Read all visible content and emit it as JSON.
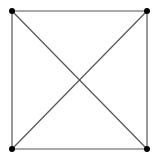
{
  "diagram": {
    "type": "graph",
    "colors": {
      "background": "#ffffff",
      "edge": "#555555",
      "node": "#000000"
    },
    "nodes": [
      {
        "id": "top-left",
        "x": 12,
        "y": 11
      },
      {
        "id": "top-right",
        "x": 147,
        "y": 11
      },
      {
        "id": "bottom-left",
        "x": 12,
        "y": 149
      },
      {
        "id": "bottom-right",
        "x": 147,
        "y": 149
      }
    ],
    "edges": [
      {
        "from": "top-left",
        "to": "top-right"
      },
      {
        "from": "top-right",
        "to": "bottom-right"
      },
      {
        "from": "bottom-right",
        "to": "bottom-left"
      },
      {
        "from": "bottom-left",
        "to": "top-left"
      },
      {
        "from": "top-left",
        "to": "bottom-right"
      },
      {
        "from": "top-right",
        "to": "bottom-left"
      }
    ]
  }
}
